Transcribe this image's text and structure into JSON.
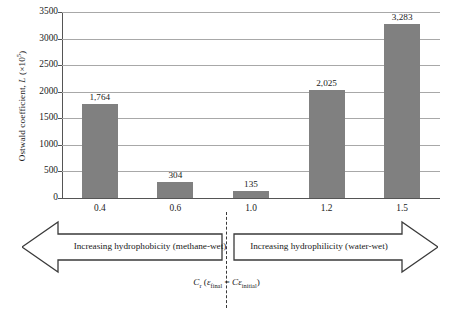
{
  "chart_data": {
    "type": "bar",
    "title": "",
    "categories": [
      "0.4",
      "0.6",
      "1.0",
      "1.2",
      "1.5"
    ],
    "values": [
      1764,
      304,
      135,
      2025,
      3283
    ],
    "value_labels": [
      "1,764",
      "304",
      "135",
      "2,025",
      "3,283"
    ],
    "xlabel": "",
    "ylabel": "Ostwald coefficient, L (×10⁵)",
    "ylim": [
      0,
      3500
    ],
    "yticks": [
      0,
      500,
      1000,
      1500,
      2000,
      2500,
      3000,
      3500
    ],
    "ytick_labels": [
      "0",
      "500",
      "1000",
      "1500",
      "2000",
      "2500",
      "3000",
      "3500"
    ],
    "grid": true,
    "legend": "none",
    "bar_color": "#808080",
    "gridline_color": "#a8a8a8",
    "axis_color": "#555555"
  },
  "y_axis": {
    "title_prefix": "Ostwald coefficient, ",
    "title_symbol": "L",
    "title_suffix_open": " (×10",
    "title_exponent": "5",
    "title_suffix_close": ")"
  },
  "annotations": {
    "arrow_left_label": "Increasing hydrophobicity (methane-wet)",
    "arrow_right_label": "Increasing hydrophilicity (water-wet)",
    "caption_symbol": "C",
    "caption_subscript": "r",
    "caption_open": " (",
    "caption_eps1": "ε",
    "caption_sub1": "final",
    "caption_equals": " = ",
    "caption_c2": "C",
    "caption_eps2": "ε",
    "caption_sub2": "initial",
    "caption_close": ")"
  }
}
